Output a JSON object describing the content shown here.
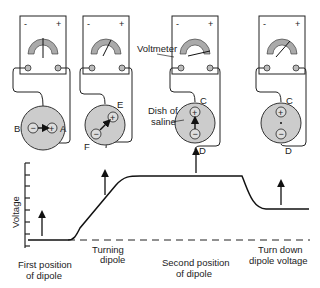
{
  "meters": [
    {
      "minus": "-",
      "plus": "+",
      "needle": "zero"
    },
    {
      "minus": "-",
      "plus": "+",
      "needle": "slight-positive"
    },
    {
      "minus": "-",
      "plus": "+",
      "needle": "full-positive"
    },
    {
      "minus": "-",
      "plus": "+",
      "needle": "reduced-positive"
    }
  ],
  "dishes": [
    {
      "left_label": "B",
      "right_label": "A",
      "neg": "−",
      "pos": "+"
    },
    {
      "top_label": "E",
      "bottom_label": "F",
      "neg": "−",
      "pos": "+"
    },
    {
      "top_label": "C",
      "bottom_label": "D",
      "neg": "−",
      "pos": "+"
    },
    {
      "top_label": "C",
      "bottom_label": "D",
      "neg": "−",
      "pos": "+"
    }
  ],
  "callouts": {
    "voltmeter": "Voltmeter",
    "dish_line1": "Dish of",
    "dish_line2": "saline"
  },
  "graph": {
    "ylabel": "Voltage",
    "phases": [
      {
        "line1": "First position",
        "line2": "of dipole"
      },
      {
        "line1": "Turning",
        "line2": "dipole"
      },
      {
        "line1": "Second position",
        "line2": "of dipole"
      },
      {
        "line1": "Turn down",
        "line2": "dipole voltage"
      }
    ]
  }
}
